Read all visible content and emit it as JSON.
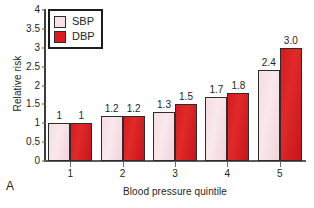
{
  "panel": {
    "letter": "A"
  },
  "chart_data": {
    "type": "bar",
    "title": "",
    "xlabel": "Blood pressure quintile",
    "ylabel": "Relative risk",
    "categories": [
      "1",
      "2",
      "3",
      "4",
      "5"
    ],
    "series": [
      {
        "name": "SBP",
        "color": "#f7e2e6",
        "values": [
          1,
          1.2,
          1.3,
          1.7,
          2.4
        ],
        "labels": [
          "1",
          "1.2",
          "1.3",
          "1.7",
          "2.4"
        ]
      },
      {
        "name": "DBP",
        "color": "#dd1b20",
        "values": [
          1,
          1.2,
          1.5,
          1.8,
          3.0
        ],
        "labels": [
          "1",
          "1.2",
          "1.5",
          "1.8",
          "3.0"
        ]
      }
    ],
    "ylim": [
      0,
      4
    ],
    "yticks": [
      "0",
      "0.5",
      "1",
      "1.5",
      "2",
      "2.5",
      "3",
      "3.5",
      "4"
    ],
    "ytick_values": [
      0,
      0.5,
      1,
      1.5,
      2,
      2.5,
      3,
      3.5,
      4
    ],
    "xticks": [
      "1",
      "2",
      "3",
      "4",
      "5"
    ],
    "grid": false,
    "legend_position": "top-left",
    "legend": [
      "SBP",
      "DBP"
    ]
  }
}
